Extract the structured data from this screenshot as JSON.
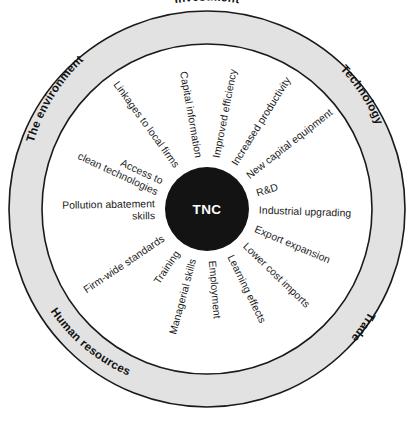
{
  "diagram": {
    "center": {
      "label": "TNC",
      "shape": "filled-circle",
      "fill": "#131313",
      "text_color": "#ffffff"
    },
    "ring": {
      "fill": "#e2e2e2",
      "stroke": "#1a1a1a",
      "labels": [
        {
          "id": "investment",
          "text": "Investment",
          "position": "top"
        },
        {
          "id": "technology",
          "text": "Technology",
          "position": "upper-right"
        },
        {
          "id": "trade",
          "text": "Trade",
          "position": "lower-right"
        },
        {
          "id": "human-resources",
          "text": "Human resources",
          "position": "lower-left"
        },
        {
          "id": "the-environment",
          "text": "The environment",
          "position": "upper-left"
        }
      ]
    },
    "spokes": [
      {
        "id": "capital-information",
        "text": "Capital information",
        "sector": "investment",
        "angle_deg": -100
      },
      {
        "id": "improved-efficiency",
        "text": "Improved efficiency",
        "sector": "investment",
        "angle_deg": -79
      },
      {
        "id": "increased-productivity",
        "text": "Increased productivity",
        "sector": "investment",
        "angle_deg": -58
      },
      {
        "id": "new-capital-equipment",
        "text": "New capital equipment",
        "sector": "technology",
        "angle_deg": -38
      },
      {
        "id": "rnd",
        "text": "R&D",
        "sector": "technology",
        "angle_deg": -17
      },
      {
        "id": "industrial-upgrading",
        "text": "Industrial upgrading",
        "sector": "technology",
        "angle_deg": 2
      },
      {
        "id": "export-expansion",
        "text": "Export expansion",
        "sector": "trade",
        "angle_deg": 23
      },
      {
        "id": "lower-cost-imports",
        "text": "Lower cost imports",
        "sector": "trade",
        "angle_deg": 44
      },
      {
        "id": "learning-effects",
        "text": "Learning effects",
        "sector": "trade",
        "angle_deg": 64
      },
      {
        "id": "employment",
        "text": "Employment",
        "sector": "human-resources",
        "angle_deg": 85
      },
      {
        "id": "managerial-skills",
        "text": "Managerial skills",
        "sector": "human-resources",
        "angle_deg": 105
      },
      {
        "id": "training",
        "text": "Training",
        "sector": "human-resources",
        "angle_deg": 124
      },
      {
        "id": "firm-wide-standards",
        "text": "Firm-wide standards",
        "sector": "human-resources",
        "angle_deg": 146
      },
      {
        "id": "pollution-abatement-skills",
        "text": "Pollution abatement",
        "text2": "skills",
        "sector": "the-environment",
        "angle_deg": 179
      },
      {
        "id": "access-to-clean-technologies",
        "text": "Access to",
        "text2": "clean technologies",
        "sector": "the-environment",
        "angle_deg": 205
      },
      {
        "id": "linkages-to-local-firms",
        "text": "Linkages to local firms",
        "sector": "the-environment",
        "angle_deg": 234
      }
    ]
  }
}
